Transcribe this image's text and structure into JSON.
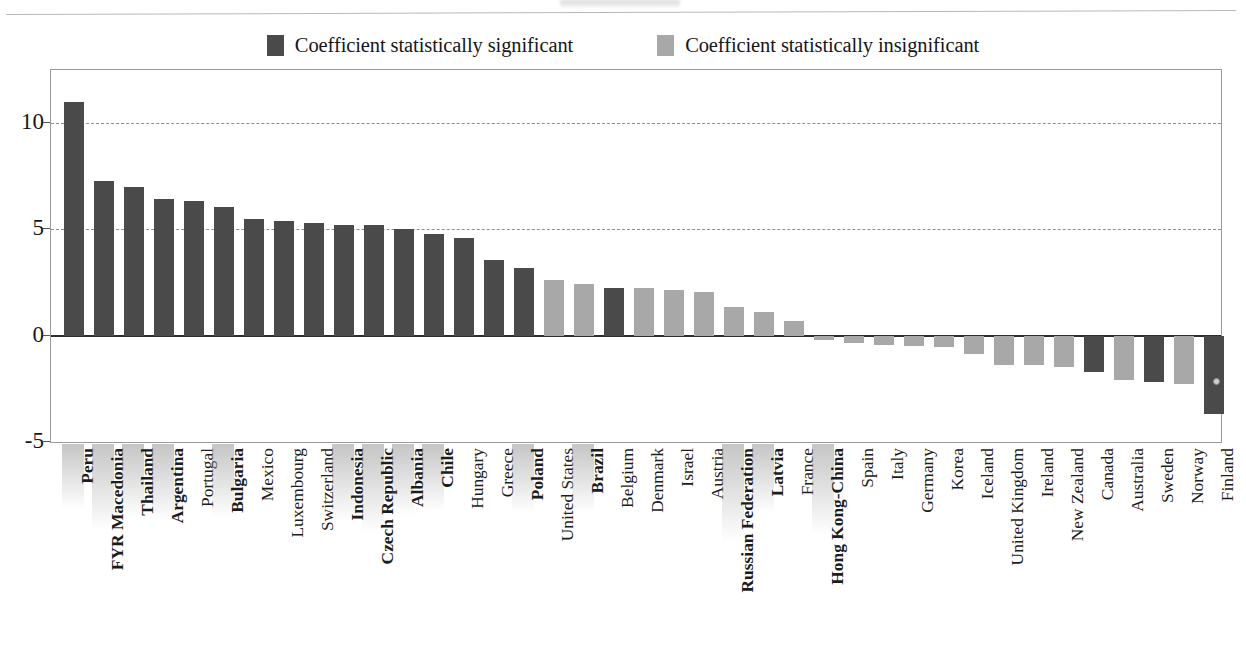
{
  "legend": {
    "items": [
      {
        "label": "Coefficient statistically significant",
        "color": "#4a4a4a",
        "key": "significant"
      },
      {
        "label": "Coefficient statistically insignificant",
        "color": "#a8a8a8",
        "key": "insignificant"
      }
    ]
  },
  "colors": {
    "significant": "#4a4a4a",
    "insignificant": "#a8a8a8",
    "axis": "#9a9a9a",
    "zero_line": "#2d2d2d",
    "gridline": "#8d8d8d",
    "text": "#16171b"
  },
  "chart_data": {
    "type": "bar",
    "title": "",
    "subtitle": "",
    "xlabel": "",
    "ylabel": "",
    "ylim": [
      -5,
      12.5
    ],
    "yticks": [
      10,
      5,
      0,
      -5
    ],
    "ytick_labels": [
      "10",
      "5",
      "0",
      "-5"
    ],
    "gridlines": [
      10,
      5
    ],
    "grid": true,
    "legend_position": "top-center",
    "categories": [
      "Peru",
      "FYR Macedonia",
      "Thailand",
      "Argentina",
      "Portugal",
      "Bulgaria",
      "Mexico",
      "Luxembourg",
      "Switzerland",
      "Indonesia",
      "Czech Republic",
      "Albania",
      "Chile",
      "Hungary",
      "Greece",
      "Poland",
      "United States",
      "Brazil",
      "Belgium",
      "Denmark",
      "Israel",
      "Austria",
      "Russian Federation",
      "Latvia",
      "France",
      "Hong Kong-China",
      "Spain",
      "Italy",
      "Germany",
      "Korea",
      "Iceland",
      "United Kingdom",
      "Ireland",
      "New Zealand",
      "Canada",
      "Australia",
      "Sweden",
      "Norway",
      "Finland"
    ],
    "values": [
      11.0,
      7.3,
      7.0,
      6.45,
      6.35,
      6.05,
      5.5,
      5.4,
      5.3,
      5.2,
      5.2,
      5.0,
      4.8,
      4.6,
      3.55,
      3.2,
      2.6,
      2.45,
      2.25,
      2.25,
      2.15,
      2.05,
      1.35,
      1.1,
      0.7,
      -0.2,
      -0.35,
      -0.45,
      -0.5,
      -0.55,
      -0.85,
      -1.4,
      -1.4,
      -1.45,
      -1.7,
      -2.1,
      -2.2,
      -2.25,
      -3.7
    ],
    "significance": [
      "significant",
      "significant",
      "significant",
      "significant",
      "significant",
      "significant",
      "significant",
      "significant",
      "significant",
      "significant",
      "significant",
      "significant",
      "significant",
      "significant",
      "significant",
      "significant",
      "insignificant",
      "insignificant",
      "significant",
      "insignificant",
      "insignificant",
      "insignificant",
      "insignificant",
      "insignificant",
      "insignificant",
      "insignificant",
      "insignificant",
      "insignificant",
      "insignificant",
      "insignificant",
      "insignificant",
      "insignificant",
      "insignificant",
      "insignificant",
      "significant",
      "insignificant",
      "significant",
      "insignificant",
      "significant"
    ],
    "bold_labels": [
      "Peru",
      "FYR Macedonia",
      "Thailand",
      "Argentina",
      "Bulgaria",
      "Indonesia",
      "Czech Republic",
      "Albania",
      "Chile",
      "Poland",
      "Brazil",
      "Russian Federation",
      "Latvia",
      "Hong Kong-China"
    ]
  }
}
